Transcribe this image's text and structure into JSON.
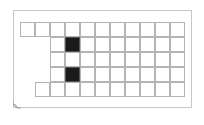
{
  "diagram": {
    "type": "grid-card",
    "cell_size": 15,
    "origin": {
      "x": 20,
      "y": 22
    },
    "columns": 11,
    "rows": [
      {
        "start_col": 0,
        "end_col": 10
      },
      {
        "start_col": 2,
        "end_col": 10
      },
      {
        "start_col": 2,
        "end_col": 10
      },
      {
        "start_col": 2,
        "end_col": 10
      },
      {
        "start_col": 1,
        "end_col": 10
      }
    ],
    "filled_cells": [
      {
        "row": 1,
        "col": 3
      },
      {
        "row": 3,
        "col": 3
      }
    ],
    "colors": {
      "border": "#c8c8c8",
      "grid_line": "#b4b4b4",
      "filled": "#1a1a1a",
      "background": "#ffffff"
    },
    "fold_icon": "page-curl-icon"
  }
}
